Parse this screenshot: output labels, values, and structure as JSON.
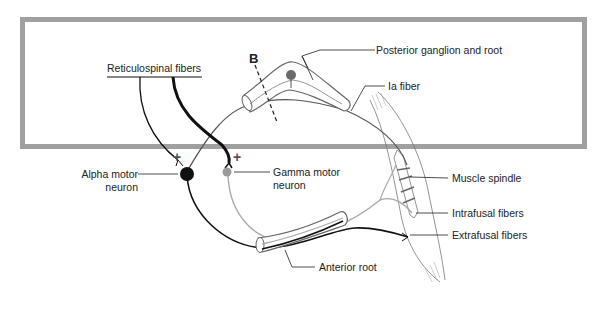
{
  "diagram": {
    "type": "neural-reflex-circuit",
    "frame_color": "#9a9a9a",
    "labels": {
      "reticulospinal": "Reticulospinal fibers",
      "section_marker": "B",
      "posterior_ganglion": "Posterior ganglion and root",
      "ia_fiber": "Ia fiber",
      "alpha_line1": "Alpha motor",
      "alpha_line2": "neuron",
      "gamma_line1": "Gamma motor",
      "gamma_line2": "neuron",
      "muscle_spindle": "Muscle spindle",
      "intrafusal": "Intrafusal fibers",
      "extrafusal": "Extrafusal fibers",
      "anterior_root": "Anterior root",
      "plus_alpha": "+",
      "plus_gamma": "+"
    },
    "colors": {
      "alpha_neuron": "#111111",
      "gamma_neuron": "#9a9a9a",
      "ganglion_cell": "#6a6a6a",
      "sensory_fiber": "#555555"
    }
  }
}
